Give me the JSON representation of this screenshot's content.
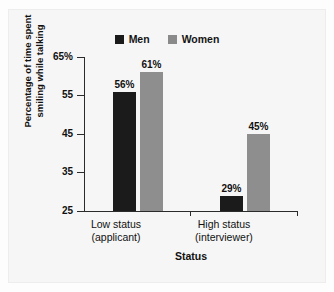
{
  "chart_data": {
    "type": "bar",
    "title": "",
    "subtitle": "",
    "xlabel": "Status",
    "ylabel_line1": "Percentage of time spent",
    "ylabel_line2": "smiling while talking",
    "categories": [
      "Low status\n(applicant)",
      "High status\n(interviewer)"
    ],
    "category_labels": [
      {
        "line1": "Low status",
        "line2": "(applicant)"
      },
      {
        "line1": "High status",
        "line2": "(interviewer)"
      }
    ],
    "series": [
      {
        "name": "Men",
        "color": "#1b1b1b",
        "values": [
          56,
          29
        ],
        "data_labels": [
          "56%",
          "45%"
        ]
      },
      {
        "name": "Women",
        "color": "#8e8e8e",
        "values": [
          61,
          45
        ],
        "data_labels": [
          "61%",
          "45%"
        ]
      }
    ],
    "bars": [
      {
        "group": 0,
        "series": "Men",
        "value": 56,
        "label": "56%"
      },
      {
        "group": 0,
        "series": "Women",
        "value": 61,
        "label": "61%"
      },
      {
        "group": 1,
        "series": "Men",
        "value": 29,
        "label": "29%"
      },
      {
        "group": 1,
        "series": "Women",
        "value": 45,
        "label": "45%"
      }
    ],
    "ylim": [
      25,
      65
    ],
    "yticks": [
      25,
      35,
      45,
      55,
      65
    ],
    "ytick_labels": [
      "25",
      "35",
      "45",
      "55",
      "65%"
    ],
    "grid": false,
    "legend_position": "top-center",
    "legend": [
      {
        "label": "Men",
        "color": "#1b1b1b"
      },
      {
        "label": "Women",
        "color": "#8e8e8e"
      }
    ]
  },
  "colors": {
    "men": "#1b1b1b",
    "women": "#8e8e8e",
    "axis": "#2b2b2b",
    "text": "#111111",
    "panel": "#f6f6f6",
    "page": "#fdfdfd"
  }
}
